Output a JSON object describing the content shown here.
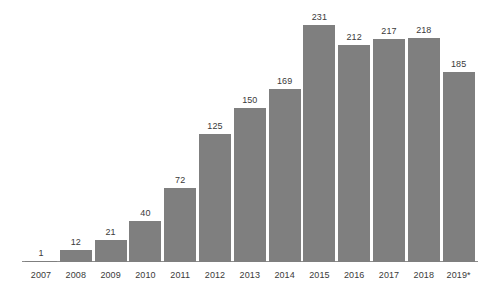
{
  "chart_data": {
    "type": "bar",
    "title": "",
    "subtitle": "",
    "xlabel": "",
    "ylabel": "",
    "categories": [
      "2007",
      "2008",
      "2009",
      "2010",
      "2011",
      "2012",
      "2013",
      "2014",
      "2015",
      "2016",
      "2017",
      "2018",
      "2019*"
    ],
    "values": [
      1,
      12,
      21,
      40,
      72,
      125,
      150,
      169,
      231,
      212,
      217,
      218,
      185
    ],
    "value_labels": [
      "1",
      "12",
      "21",
      "40",
      "72",
      "125",
      "150",
      "169",
      "231",
      "212",
      "217",
      "218",
      "185"
    ],
    "ylim": [
      0,
      231
    ],
    "grid": false,
    "legend": null,
    "annotations": [],
    "bar_color": "#7f7f7f",
    "axis_color": "#8c8c8c",
    "label_color": "#3a3a3a",
    "background_color": "#ffffff"
  }
}
